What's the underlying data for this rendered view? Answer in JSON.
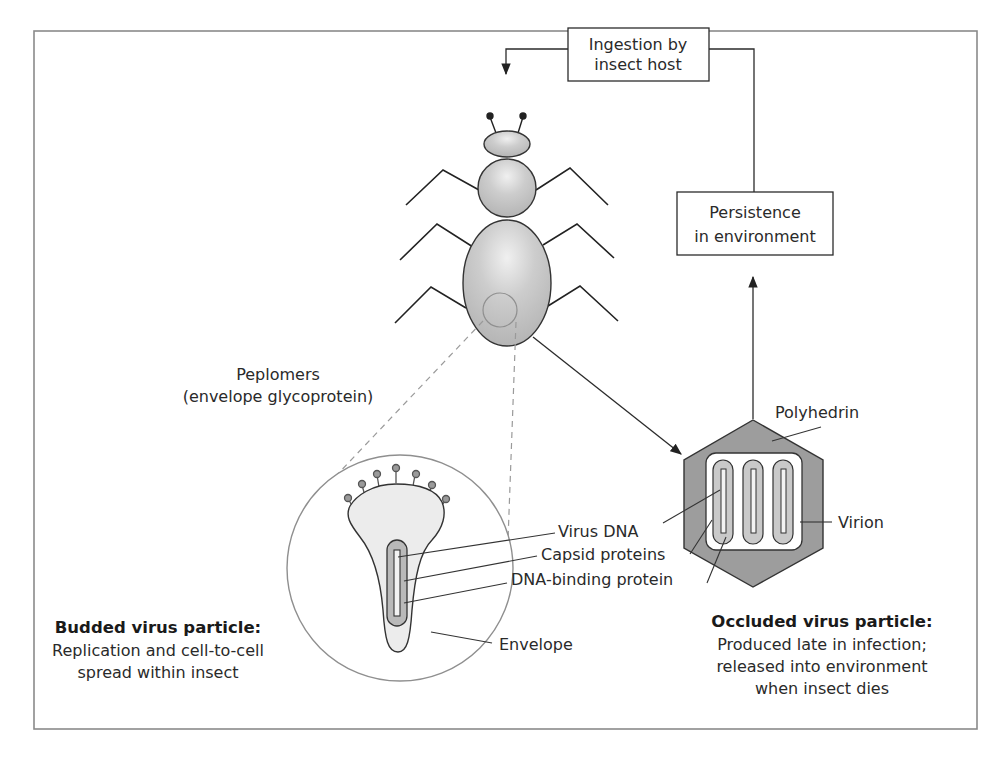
{
  "diagram": {
    "type": "baculovirus life cycle",
    "boxes": {
      "ingestion": {
        "line1": "Ingestion by",
        "line2": "insect host"
      },
      "persistence": {
        "line1": "Persistence",
        "line2": "in environment"
      }
    },
    "labels": {
      "peplomers_line1": "Peplomers",
      "peplomers_line2": "(envelope glycoprotein)",
      "polyhedrin": "Polyhedrin",
      "virion": "Virion",
      "virus_dna": "Virus DNA",
      "capsid_proteins": "Capsid proteins",
      "dna_binding_protein": "DNA-binding protein",
      "envelope": "Envelope"
    },
    "budded": {
      "title": "Budded virus particle:",
      "line1": "Replication and cell-to-cell",
      "line2": "spread within insect"
    },
    "occluded": {
      "title": "Occluded virus particle:",
      "line1": "Produced late in infection;",
      "line2": "released into environment",
      "line3": "when insect dies"
    },
    "colors": {
      "frame": "#8a8a8a",
      "line": "#2b2b2b",
      "insect_fill": "#c4c4c4",
      "polyhedrin_fill": "#9d9d9d",
      "virion_fill": "#c9c9c9",
      "envelope_fill": "#ececec",
      "circle_stroke": "#8f8f8f",
      "dash": "#9a9a9a"
    }
  }
}
